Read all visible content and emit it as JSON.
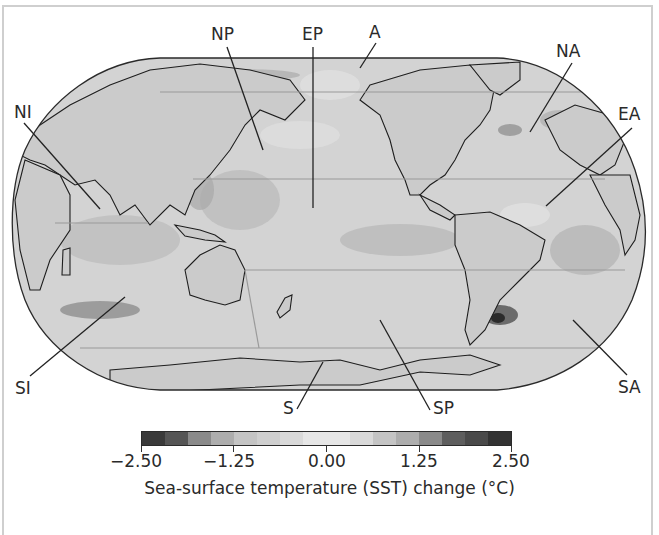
{
  "map": {
    "title": "Sea-surface temperature (SST) change map",
    "projection": "Robinson-like world projection",
    "regions": [
      {
        "code": "NP",
        "name": "North Pacific"
      },
      {
        "code": "EP",
        "name": "Equatorial Pacific"
      },
      {
        "code": "A",
        "name": "Arctic"
      },
      {
        "code": "NA",
        "name": "North Atlantic"
      },
      {
        "code": "NI",
        "name": "North Indian"
      },
      {
        "code": "EA",
        "name": "Equatorial Atlantic"
      },
      {
        "code": "SI",
        "name": "South Indian"
      },
      {
        "code": "S",
        "name": "Southern Ocean"
      },
      {
        "code": "SP",
        "name": "South Pacific"
      },
      {
        "code": "SA",
        "name": "South Atlantic"
      }
    ],
    "labels": {
      "np": "NP",
      "ep": "EP",
      "a": "A",
      "na": "NA",
      "ni": "NI",
      "ea": "EA",
      "si": "SI",
      "s": "S",
      "sp": "SP",
      "sa": "SA"
    },
    "colors": {
      "ocean_base": "#cfcfcf",
      "land": "#c9c9c9",
      "coast": "#1e1e1e",
      "warm_dark": "#3c3c3c"
    }
  },
  "colorbar": {
    "min": -2.5,
    "max": 2.5,
    "tick_labels": [
      "−2.50",
      "−1.25",
      "0.00",
      "1.25",
      "2.50"
    ],
    "tick_values": [
      -2.5,
      -1.25,
      0.0,
      1.25,
      2.5
    ],
    "segments": 16,
    "segment_colors": [
      "#3a3a3a",
      "#555555",
      "#8a8a8a",
      "#adadad",
      "#c4c4c4",
      "#cfcfcf",
      "#d9d9d9",
      "#e6e6e6",
      "#e6e6e6",
      "#d9d9d9",
      "#c4c4c4",
      "#adadad",
      "#8a8a8a",
      "#5e5e5e",
      "#4a4a4a",
      "#333333"
    ],
    "title": "Sea-surface temperature (SST) change (°C)"
  }
}
